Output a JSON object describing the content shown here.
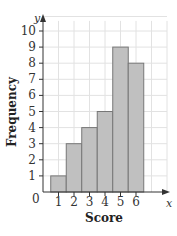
{
  "chart_data": {
    "type": "bar",
    "title": "",
    "xlabel": "Score",
    "ylabel": "Frequency",
    "x_axis_var": "x",
    "y_axis_var": "y",
    "origin_label": "0",
    "categories": [
      "1",
      "2",
      "3",
      "4",
      "5",
      "6"
    ],
    "values": [
      1,
      3,
      4,
      5,
      9,
      8
    ],
    "yticks": [
      "1",
      "2",
      "3",
      "4",
      "5",
      "6",
      "7",
      "8",
      "9",
      "10"
    ],
    "ylim": [
      0,
      10
    ],
    "grid": true,
    "bar_color": "#c0c0c0",
    "bar_edge_color": "#777777",
    "histogram": true
  }
}
